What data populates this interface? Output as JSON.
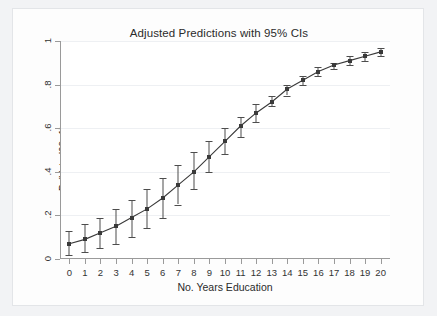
{
  "figure": {
    "background_color": "#f2f3f5",
    "panel_color": "#ffffff",
    "axis_color": "#9a9a9a",
    "series_color": "#3a3a3a"
  },
  "chart_data": {
    "type": "line",
    "title": "Adjusted Predictions with 95% CIs",
    "xlabel": "No. Years Education",
    "ylabel": "Pr(Voted08=1)",
    "xlim": [
      -0.6,
      20.6
    ],
    "ylim": [
      0,
      1
    ],
    "grid": true,
    "legend": null,
    "xticks": [
      0,
      1,
      2,
      3,
      4,
      5,
      6,
      7,
      8,
      9,
      10,
      11,
      12,
      13,
      14,
      15,
      16,
      17,
      18,
      19,
      20
    ],
    "xtick_labels": [
      "0",
      "1",
      "2",
      "3",
      "4",
      "5",
      "6",
      "7",
      "8",
      "9",
      "10",
      "11",
      "12",
      "13",
      "14",
      "15",
      "16",
      "17",
      "18",
      "19",
      "20"
    ],
    "yticks": [
      0,
      0.2,
      0.4,
      0.6,
      0.8,
      1
    ],
    "ytick_labels": [
      "0",
      ".2",
      ".4",
      ".6",
      ".8",
      "1"
    ],
    "x": [
      0,
      1,
      2,
      3,
      4,
      5,
      6,
      7,
      8,
      9,
      10,
      11,
      12,
      13,
      14,
      15,
      16,
      17,
      18,
      19,
      20
    ],
    "series": [
      {
        "name": "Pr(Voted08=1)",
        "marker": "square",
        "values": [
          0.07,
          0.09,
          0.12,
          0.15,
          0.19,
          0.23,
          0.28,
          0.34,
          0.4,
          0.47,
          0.54,
          0.61,
          0.67,
          0.72,
          0.78,
          0.82,
          0.86,
          0.89,
          0.91,
          0.93,
          0.95
        ],
        "ci_lower": [
          0.02,
          0.03,
          0.05,
          0.07,
          0.1,
          0.14,
          0.19,
          0.25,
          0.32,
          0.4,
          0.48,
          0.56,
          0.63,
          0.7,
          0.75,
          0.8,
          0.84,
          0.87,
          0.89,
          0.91,
          0.93
        ],
        "ci_upper": [
          0.13,
          0.16,
          0.19,
          0.23,
          0.27,
          0.32,
          0.37,
          0.43,
          0.49,
          0.54,
          0.6,
          0.65,
          0.71,
          0.75,
          0.8,
          0.84,
          0.88,
          0.9,
          0.93,
          0.95,
          0.97
        ]
      }
    ],
    "annotations": []
  }
}
